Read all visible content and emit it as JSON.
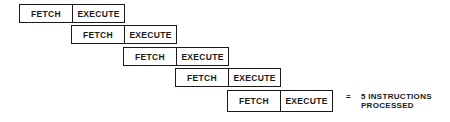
{
  "diagram": {
    "rows": [
      {
        "fetch": "FETCH",
        "execute": "EXECUTE"
      },
      {
        "fetch": "FETCH",
        "execute": "EXECUTE"
      },
      {
        "fetch": "FETCH",
        "execute": "EXECUTE"
      },
      {
        "fetch": "FETCH",
        "execute": "EXECUTE"
      },
      {
        "fetch": "FETCH",
        "execute": "EXECUTE"
      }
    ],
    "result": {
      "equals": "=",
      "line1": "5 INSTRUCTIONS",
      "line2": "PROCESSED"
    }
  }
}
